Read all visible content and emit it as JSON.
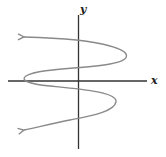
{
  "diagram": {
    "type": "graph-of-relation",
    "axes": {
      "x_label": "x",
      "y_label": "y",
      "color": "#333333"
    },
    "curve": {
      "color": "#8a8a8a",
      "ends": [
        "arrow-upper-left",
        "arrow-lower-left"
      ],
      "turning_points": [
        {
          "side": "right",
          "position": "upper"
        },
        {
          "side": "left",
          "position": "near x-axis"
        },
        {
          "side": "right",
          "position": "lower"
        }
      ]
    }
  }
}
